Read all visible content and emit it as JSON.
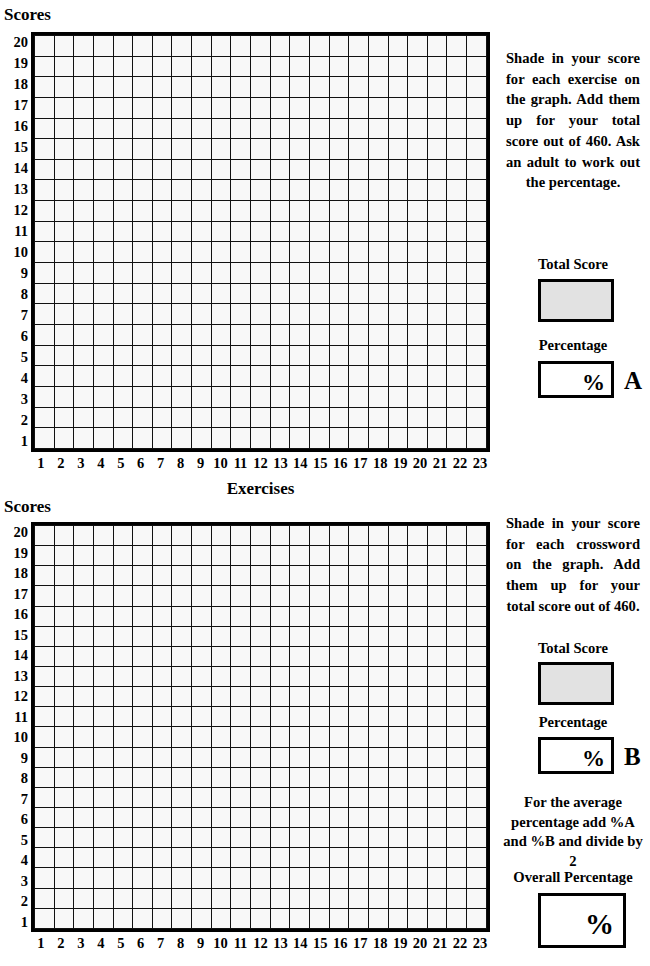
{
  "document": {
    "title": "Scores Recording Grid Worksheet"
  },
  "axes": {
    "y_title": "Scores",
    "x_title": "Exercises",
    "y_ticks": [
      20,
      19,
      18,
      17,
      16,
      15,
      14,
      13,
      12,
      11,
      10,
      9,
      8,
      7,
      6,
      5,
      4,
      3,
      2,
      1
    ],
    "x_ticks": [
      1,
      2,
      3,
      4,
      5,
      6,
      7,
      8,
      9,
      10,
      11,
      12,
      13,
      14,
      15,
      16,
      17,
      18,
      19,
      20,
      21,
      22,
      23
    ]
  },
  "chart_data": [
    {
      "type": "grid",
      "id": "chart-a",
      "title": "",
      "xlabel": "Exercises",
      "ylabel": "Scores",
      "categories": [
        1,
        2,
        3,
        4,
        5,
        6,
        7,
        8,
        9,
        10,
        11,
        12,
        13,
        14,
        15,
        16,
        17,
        18,
        19,
        20,
        21,
        22,
        23
      ],
      "ytick_labels": [
        20,
        19,
        18,
        17,
        16,
        15,
        14,
        13,
        12,
        11,
        10,
        9,
        8,
        7,
        6,
        5,
        4,
        3,
        2,
        1
      ],
      "ylim": [
        1,
        20
      ],
      "columns": 23,
      "rows": 20,
      "values": [],
      "grid": true,
      "legend": "none",
      "max_total": 460
    },
    {
      "type": "grid",
      "id": "chart-b",
      "title": "",
      "xlabel": "Exercises",
      "ylabel": "Scores",
      "categories": [
        1,
        2,
        3,
        4,
        5,
        6,
        7,
        8,
        9,
        10,
        11,
        12,
        13,
        14,
        15,
        16,
        17,
        18,
        19,
        20,
        21,
        22,
        23
      ],
      "ytick_labels": [
        20,
        19,
        18,
        17,
        16,
        15,
        14,
        13,
        12,
        11,
        10,
        9,
        8,
        7,
        6,
        5,
        4,
        3,
        2,
        1
      ],
      "ylim": [
        1,
        20
      ],
      "columns": 23,
      "rows": 20,
      "values": [],
      "grid": true,
      "legend": "none",
      "max_total": 460
    }
  ],
  "panel_a": {
    "instructions": "Shade in your score for each exercise on the graph. Add them up for your total score out of 460. Ask an adult to work out the percentage.",
    "total_score_label": "Total Score",
    "total_score_value": "",
    "percentage_label": "Percentage",
    "percent_symbol": "%",
    "percentage_value": "",
    "tag": "A"
  },
  "panel_b": {
    "instructions": "Shade in your score for each crossword on the graph. Add them up for your total score out of 460.",
    "total_score_label": "Total Score",
    "total_score_value": "",
    "percentage_label": "Percentage",
    "percent_symbol": "%",
    "percentage_value": "",
    "tag": "B",
    "average_note": "For the average percentage add %A and %B and divide by 2",
    "overall_label": "Overall Percentage",
    "overall_percent_symbol": "%",
    "overall_value": ""
  },
  "colors": {
    "ink": "#000000",
    "cell_fill": "#f8f8f8",
    "shaded_box": "#e2e2e2",
    "background": "#ffffff"
  }
}
